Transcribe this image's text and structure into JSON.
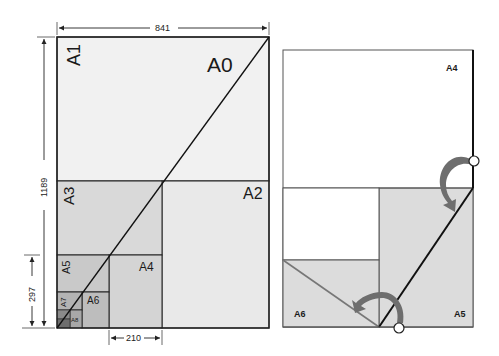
{
  "left_figure": {
    "title": "ISO A-series paper sizes nested",
    "labels": {
      "a0": "A0",
      "a1": "A1",
      "a2": "A2",
      "a3": "A3",
      "a4": "A4",
      "a5": "A5",
      "a6": "A6",
      "a7": "A7",
      "a8": "A8"
    },
    "dimensions": {
      "width_a0": "841",
      "height_a0": "1189",
      "height_a4": "297",
      "width_a4": "210"
    }
  },
  "right_figure": {
    "title": "Folding A4 into A5 and A6",
    "labels": {
      "a4": "A4",
      "a5": "A5",
      "a6": "A6"
    }
  },
  "colors": {
    "a1_fill": "#f1f1f1",
    "a2_fill": "#e9e9e9",
    "a3_fill": "#d9d9d9",
    "a4_fill": "#d4d4d4",
    "a5_fill": "#c9c9c9",
    "a6_fill": "#bdbdbd",
    "a7_fill": "#b3b3b3",
    "a8_fill": "#a8a8a8",
    "a9_fill": "#7a7a7a",
    "fold_fill": "#dcdcdc",
    "arrow_fill": "#6e6e6e",
    "line": "#222222"
  }
}
